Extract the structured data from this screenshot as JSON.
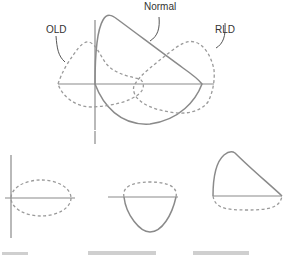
{
  "diagram": {
    "labels": {
      "normal": "Normal",
      "old": "OLD",
      "rld": "RLD"
    },
    "curves": [
      {
        "id": "normal",
        "style": "solid",
        "label": "Normal"
      },
      {
        "id": "old",
        "style": "dashed",
        "label": "OLD"
      },
      {
        "id": "rld",
        "style": "dashed",
        "label": "RLD"
      }
    ],
    "small_panels": [
      {
        "id": "panel-1",
        "description": "dashed flat oval loop centered on axis"
      },
      {
        "id": "panel-2",
        "description": "dashed upper arc with solid lower U-shaped curve"
      },
      {
        "id": "panel-3",
        "description": "solid upper peaked curve with dashed shallow lower arc"
      }
    ],
    "colors": {
      "line": "#8a8a8a",
      "text": "#333333"
    }
  }
}
